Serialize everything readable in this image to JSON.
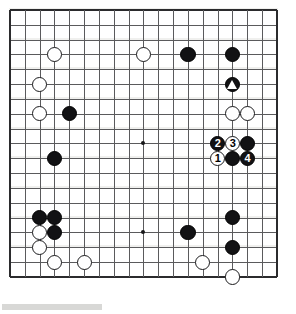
{
  "board": {
    "title": "Go game diagram",
    "size": 19,
    "origin_x": 10,
    "origin_y": 10,
    "spacing": 14.83,
    "grid_color": "#5a5a5c",
    "edge_color": "#2b2b2d",
    "background_color": "#ffffff",
    "black_color": "#121214",
    "white_color": "#ffffff",
    "stone_radius": 7.6,
    "hoshi": [
      {
        "col": 4,
        "row": 4
      },
      {
        "col": 10,
        "row": 4
      },
      {
        "col": 16,
        "row": 4
      },
      {
        "col": 4,
        "row": 10
      },
      {
        "col": 10,
        "row": 10
      },
      {
        "col": 16,
        "row": 10
      },
      {
        "col": 4,
        "row": 16
      },
      {
        "col": 10,
        "row": 16
      },
      {
        "col": 16,
        "row": 16
      }
    ],
    "visible_hoshi": [
      {
        "col": 10,
        "row": 10
      },
      {
        "col": 4,
        "row": 16
      },
      {
        "col": 10,
        "row": 16
      }
    ],
    "stones": [
      {
        "col": 4,
        "row": 4,
        "color": "white",
        "label": "",
        "mark": ""
      },
      {
        "col": 10,
        "row": 4,
        "color": "white",
        "label": "",
        "mark": ""
      },
      {
        "col": 13,
        "row": 4,
        "color": "black",
        "label": "",
        "mark": ""
      },
      {
        "col": 16,
        "row": 4,
        "color": "black",
        "label": "",
        "mark": ""
      },
      {
        "col": 3,
        "row": 6,
        "color": "white",
        "label": "",
        "mark": ""
      },
      {
        "col": 16,
        "row": 6,
        "color": "black",
        "label": "",
        "mark": "triangle"
      },
      {
        "col": 3,
        "row": 8,
        "color": "white",
        "label": "",
        "mark": ""
      },
      {
        "col": 5,
        "row": 8,
        "color": "black",
        "label": "",
        "mark": ""
      },
      {
        "col": 16,
        "row": 8,
        "color": "white",
        "label": "",
        "mark": ""
      },
      {
        "col": 17,
        "row": 8,
        "color": "white",
        "label": "",
        "mark": ""
      },
      {
        "col": 15,
        "row": 10,
        "color": "black",
        "label": "2",
        "mark": ""
      },
      {
        "col": 16,
        "row": 10,
        "color": "white",
        "label": "3",
        "mark": ""
      },
      {
        "col": 17,
        "row": 10,
        "color": "black",
        "label": "",
        "mark": ""
      },
      {
        "col": 4,
        "row": 11,
        "color": "black",
        "label": "",
        "mark": ""
      },
      {
        "col": 15,
        "row": 11,
        "color": "white",
        "label": "1",
        "mark": ""
      },
      {
        "col": 16,
        "row": 11,
        "color": "black",
        "label": "",
        "mark": ""
      },
      {
        "col": 17,
        "row": 11,
        "color": "black",
        "label": "4",
        "mark": ""
      },
      {
        "col": 3,
        "row": 15,
        "color": "black",
        "label": "",
        "mark": ""
      },
      {
        "col": 4,
        "row": 15,
        "color": "black",
        "label": "",
        "mark": ""
      },
      {
        "col": 16,
        "row": 15,
        "color": "black",
        "label": "",
        "mark": ""
      },
      {
        "col": 3,
        "row": 16,
        "color": "white",
        "label": "",
        "mark": ""
      },
      {
        "col": 4,
        "row": 16,
        "color": "black",
        "label": "",
        "mark": ""
      },
      {
        "col": 13,
        "row": 16,
        "color": "black",
        "label": "",
        "mark": ""
      },
      {
        "col": 3,
        "row": 17,
        "color": "white",
        "label": "",
        "mark": ""
      },
      {
        "col": 16,
        "row": 17,
        "color": "black",
        "label": "",
        "mark": ""
      },
      {
        "col": 4,
        "row": 18,
        "color": "white",
        "label": "",
        "mark": ""
      },
      {
        "col": 6,
        "row": 18,
        "color": "white",
        "label": "",
        "mark": ""
      },
      {
        "col": 14,
        "row": 18,
        "color": "white",
        "label": "",
        "mark": ""
      },
      {
        "col": 16,
        "row": 19,
        "color": "white",
        "label": "",
        "mark": ""
      }
    ],
    "move_sequence": [
      {
        "number": "1",
        "color": "white"
      },
      {
        "number": "2",
        "color": "black"
      },
      {
        "number": "3",
        "color": "white"
      },
      {
        "number": "4",
        "color": "black"
      }
    ]
  },
  "bottom_bar": {
    "fill_color": "#d8d8d6"
  }
}
